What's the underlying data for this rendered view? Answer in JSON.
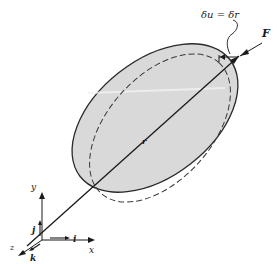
{
  "diagram": {
    "labels": {
      "displacement": "δu = δr",
      "force": "F",
      "position_vector": "r",
      "y_axis": "y",
      "x_axis": "x",
      "z_axis": "z",
      "unit_i": "i",
      "unit_j": "j",
      "unit_k": "k"
    },
    "colors": {
      "body_fill": "#d9d9d9",
      "outline": "#2a2a2a",
      "dashed_outline": "#3a3a3a",
      "background": "#ffffff"
    },
    "elements": [
      {
        "name": "solid-body-ellipse",
        "style": "solid, shaded"
      },
      {
        "name": "displaced-body-ellipse",
        "style": "dashed"
      },
      {
        "name": "position-vector-r",
        "from": "origin",
        "to": "point of force application"
      },
      {
        "name": "force-arrow-F",
        "direction": "pointing toward body at upper right"
      },
      {
        "name": "coordinate-frame",
        "axes": [
          "x",
          "y",
          "z"
        ],
        "unit_vectors": [
          "i",
          "j",
          "k"
        ]
      }
    ]
  }
}
